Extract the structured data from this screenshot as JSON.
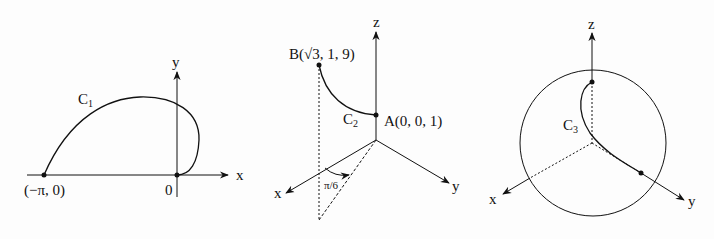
{
  "panels": [
    {
      "name": "C1",
      "curve_label": "C",
      "curve_sub": "1",
      "axis_x": "x",
      "axis_y": "y",
      "start_point": "(−π, 0)",
      "origin": "0"
    },
    {
      "name": "C2",
      "curve_label": "C",
      "curve_sub": "2",
      "axis_x": "x",
      "axis_y": "y",
      "axis_z": "z",
      "point_b": "B(√3, 1, 9)",
      "point_a": "A(0, 0, 1)",
      "angle": "π/6"
    },
    {
      "name": "C3",
      "curve_label": "C",
      "curve_sub": "3",
      "axis_x": "x",
      "axis_y": "y",
      "axis_z": "z"
    }
  ],
  "colors": {
    "ink": "#111111",
    "background": "#fdfdfd"
  }
}
